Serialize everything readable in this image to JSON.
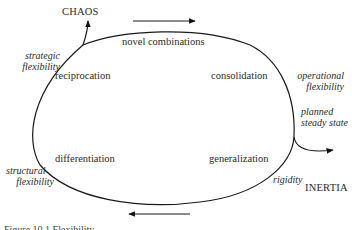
{
  "diagram": {
    "type": "cycle-diagram",
    "top_arrow_direction": "right",
    "bottom_arrow_direction": "left",
    "exits": {
      "chaos": "CHAOS",
      "inertia": "INERTIA"
    },
    "stages": {
      "top": "novel combinations",
      "upper_left": "reciprocation",
      "upper_right": "consolidation",
      "lower_left": "differentiation",
      "lower_right": "generalization"
    },
    "flexibility_labels": {
      "strategic": [
        "strategic",
        "flexibility"
      ],
      "operational": [
        "operational",
        "flexibility"
      ],
      "planned": [
        "planned",
        "steady state"
      ],
      "structural": [
        "structural",
        "flexibility"
      ],
      "rigidity": "rigidity"
    },
    "caption": "Figure 10.1   Flexibility"
  }
}
